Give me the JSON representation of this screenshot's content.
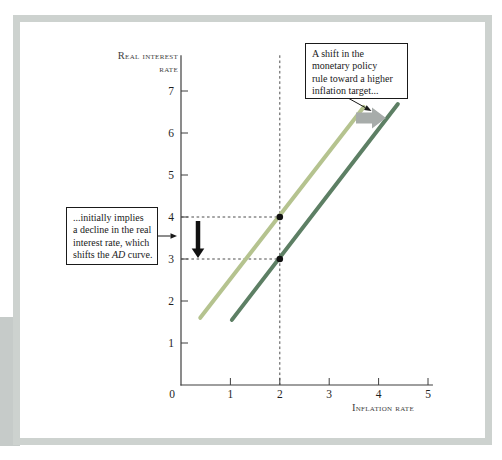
{
  "figure": {
    "frame_color": "#cdd2cf",
    "edge_block_color": "#c6cbc9"
  },
  "chart": {
    "y_axis_title": "Real interest\nrate",
    "x_axis_title": "Inflation rate"
  },
  "chart_data": {
    "type": "line",
    "title": "",
    "xlabel": "Inflation rate",
    "ylabel": "Real interest rate",
    "xlim": [
      0,
      5.1
    ],
    "ylim": [
      0,
      7.85
    ],
    "x_ticks": [
      0,
      1,
      2,
      3,
      4,
      5
    ],
    "y_ticks": [
      1,
      2,
      3,
      4,
      5,
      6,
      7
    ],
    "grid": false,
    "legend": "none",
    "series": [
      {
        "name": "Initial monetary policy rule",
        "color": "#b5c38f",
        "points": [
          [
            0.39,
            1.6
          ],
          [
            3.7,
            6.62
          ]
        ]
      },
      {
        "name": "Shifted monetary policy rule (higher inflation target)",
        "color": "#5d7f64",
        "points": [
          [
            1.03,
            1.55
          ],
          [
            4.39,
            6.69
          ]
        ]
      }
    ],
    "points": [
      {
        "x": 2,
        "y": 4
      },
      {
        "x": 2,
        "y": 3
      }
    ],
    "guides": {
      "vline_x": 2,
      "hlines_y": [
        4,
        3
      ]
    }
  },
  "annotations": {
    "top_box_text": "A shift in the\nmonetary policy\nrule toward a higher\ninflation target...",
    "left_box_part1": "...initially implies\na decline in the real\ninterest rate, which\nshifts the ",
    "left_box_italic": "AD",
    "left_box_part2": " curve.",
    "shift_arrow_color": "#a7acaa",
    "pointers": {
      "top_pointer": {
        "x1": 348,
        "y1": 98,
        "x2": 371.5,
        "y2": 111
      },
      "left_pointer": {
        "x1": 158,
        "y1": 236,
        "x2": 177,
        "y2": 236
      },
      "down_arrow": {
        "x": 198,
        "top": 221,
        "tip": 258
      },
      "shift_arrow": {
        "tail_x": 356,
        "tip_x": 386,
        "cy": 118,
        "tail_h": 11,
        "head_h": 21,
        "neck_x": 372
      }
    }
  }
}
